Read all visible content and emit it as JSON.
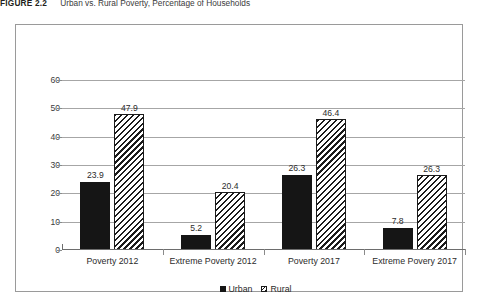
{
  "figure": {
    "number": "FIGURE 2.2",
    "title": "Urban vs. Rural Poverty, Percentage of Households"
  },
  "legend": {
    "position": "bottom-center",
    "items": [
      {
        "label": "Urban",
        "swatch": "solid-black-square-icon",
        "color": "#151515"
      },
      {
        "label": "Rural",
        "swatch": "diagonal-hatch-square-icon",
        "color": "#1b1b1b"
      }
    ]
  },
  "chart_data": {
    "type": "bar",
    "title": "Urban vs. Rural Poverty, Percentage of Households",
    "xlabel": "",
    "ylabel": "",
    "ylim": [
      0,
      60
    ],
    "yticks": [
      0,
      10,
      20,
      30,
      40,
      50,
      60
    ],
    "ytick_labels": [
      "0",
      "10",
      "20",
      "30",
      "40",
      "50",
      "60"
    ],
    "grid": true,
    "grid_axis": "y",
    "legend_position": "bottom-center",
    "categories": [
      "Poverty 2012",
      "Extreme Poverty 2012",
      "Poverty 2017",
      "Extreme Povery 2017"
    ],
    "series": [
      {
        "name": "Urban",
        "color": "#151515",
        "fill": "solid",
        "values": [
          23.9,
          5.2,
          26.3,
          7.8
        ],
        "labels": [
          "23.9",
          "5.2",
          "26.3",
          "7.8"
        ]
      },
      {
        "name": "Rural",
        "color": "#1b1b1b",
        "fill": "diagonal-hatch",
        "values": [
          47.9,
          20.4,
          46.4,
          26.3
        ],
        "labels": [
          "47.9",
          "20.4",
          "46.4",
          "26.3"
        ]
      }
    ]
  }
}
